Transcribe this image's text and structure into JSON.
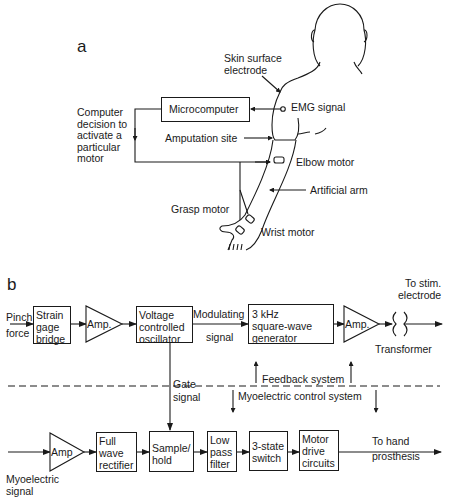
{
  "panel_a": {
    "label": "a",
    "skin_electrode": "Skin surface\nelectrode",
    "emg_signal": "EMG signal",
    "microcomputer": "Microcomputer",
    "computer_decision": "Computer\ndecision to\nactivate a\nparticular\nmotor",
    "amputation_site": "Amputation site",
    "elbow_motor": "Elbow motor",
    "artificial_arm": "Artificial arm",
    "grasp_motor": "Grasp motor",
    "wrist_motor": "Wrist motor"
  },
  "panel_b": {
    "label": "b",
    "pinch_force": "Pinch\nforce",
    "strain_gage": "Strain\ngage\nbridge",
    "amp1": "Amp.",
    "vco": "Voltage\ncontrolled\noscillator",
    "modulating": "Modulating",
    "signal": "signal",
    "square_wave": "3 kHz\nsquare-wave\ngenerator",
    "amp2": "Amp.",
    "to_stim": "To stim.\nelectrode",
    "transformer": "Transformer",
    "gate_signal": "Gate\nsignal",
    "feedback_system": "Feedback system",
    "myoelectric_control": "Myoelectric control system",
    "amp3": "Amp",
    "full_wave": "Full\nwave\nrectifier",
    "sample_hold": "Sample/\nhold",
    "low_pass": "Low\npass\nfilter",
    "three_state": "3-state\nswitch",
    "motor_drive": "Motor\ndrive\ncircuits",
    "to_hand": "To hand\nprosthesis",
    "myoelectric_signal": "Myoelectric\nsignal"
  }
}
